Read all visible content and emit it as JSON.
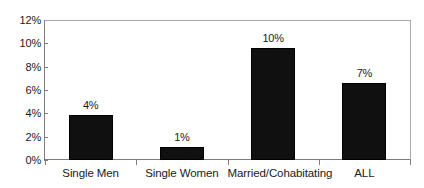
{
  "chart_data": {
    "type": "bar",
    "title": "",
    "subtitle": "",
    "xlabel": "",
    "ylabel": "",
    "categories": [
      "Single Men",
      "Single Women",
      "Married/Cohabitating",
      "ALL"
    ],
    "values": [
      3.85,
      1.1,
      9.7,
      6.65
    ],
    "data_labels": [
      "4%",
      "1%",
      "10%",
      "7%"
    ],
    "ylim": [
      0,
      12
    ],
    "ytick_values": [
      0,
      2,
      4,
      6,
      8,
      10,
      12
    ],
    "ytick_labels": [
      "0%",
      "2%",
      "4%",
      "6%",
      "8%",
      "10%",
      "12%"
    ],
    "grid": false,
    "legend": false,
    "legend_position": "none",
    "series": [
      {
        "name": "",
        "values": [
          3.85,
          1.1,
          9.7,
          6.65
        ],
        "color": "#101010"
      }
    ],
    "colors": {
      "bar": "#101010",
      "bar_edge": "#000000",
      "axis": "#7d7d7d",
      "frame": "#a8a8a8",
      "text": "#1a1a1a",
      "background": "#ffffff"
    }
  }
}
